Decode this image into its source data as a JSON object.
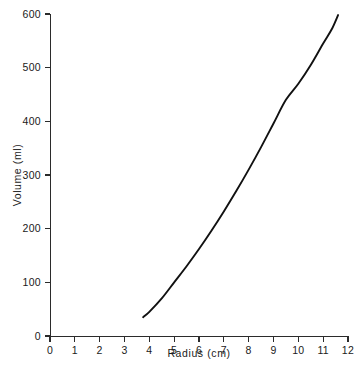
{
  "chart_data": {
    "type": "line",
    "title": "",
    "xlabel": "Radius  (cm)",
    "ylabel": "Volume  (ml)",
    "xlim": [
      0,
      12
    ],
    "ylim": [
      0,
      600
    ],
    "grid": false,
    "legend": null,
    "x_ticks": [
      "0",
      "1",
      "2",
      "3",
      "4",
      "5",
      "6",
      "7",
      "8",
      "9",
      "10",
      "11",
      "12"
    ],
    "x_tick_values": [
      0,
      1,
      2,
      3,
      4,
      5,
      6,
      7,
      8,
      9,
      10,
      11,
      12
    ],
    "y_ticks": [
      "0",
      "100",
      "200",
      "300",
      "400",
      "500",
      "600"
    ],
    "y_tick_values": [
      0,
      100,
      200,
      300,
      400,
      500,
      600
    ],
    "series": [
      {
        "name": "Volume vs Radius",
        "color": "#111111",
        "x": [
          3.75,
          4.0,
          4.5,
          5.0,
          5.5,
          6.0,
          6.5,
          7.0,
          7.5,
          8.0,
          8.5,
          9.0,
          9.5,
          10.0,
          10.5,
          11.0,
          11.35,
          11.6
        ],
        "y": [
          35,
          45,
          70,
          100,
          130,
          162,
          196,
          232,
          270,
          310,
          352,
          396,
          440,
          470,
          505,
          545,
          572,
          598
        ]
      }
    ]
  },
  "axes": {
    "x_axis_name": "radius-axis",
    "y_axis_name": "volume-axis"
  }
}
